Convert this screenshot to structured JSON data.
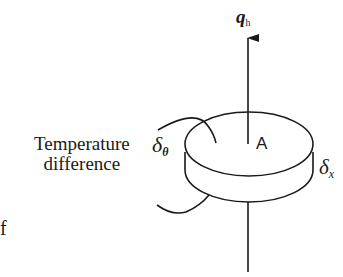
{
  "figure": {
    "type": "heat-conduction-disk-element",
    "labels": {
      "flux_symbol": "q",
      "flux_subscript": "h",
      "area": "A",
      "temperature_text_line1": "Temperature",
      "temperature_text_line2": "difference",
      "delta_theta_symbol": "δ",
      "delta_theta_subscript": "θ",
      "delta_x_symbol": "δ",
      "delta_x_subscript": "x",
      "edge_fragment": "f"
    },
    "colors": {
      "stroke": "#1a1a1a",
      "background": "#ffffff"
    }
  }
}
